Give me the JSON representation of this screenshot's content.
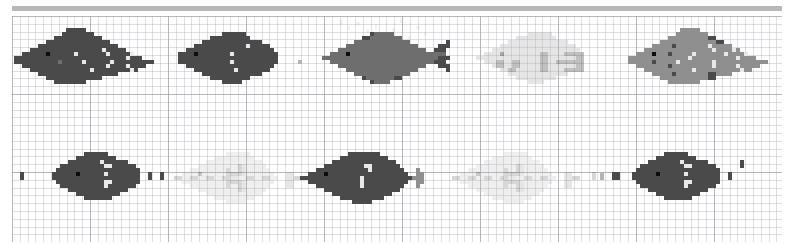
{
  "canvas": {
    "width": 790,
    "height": 244,
    "background": "#ffffff",
    "grid": {
      "minor_cell_px": 7.8,
      "major_cell_px": 78,
      "minor_color": "#afafb9",
      "major_color": "#9696a0",
      "visible": true
    },
    "topbar": {
      "color": "#b8b8b8",
      "x": 12,
      "y": 6,
      "width": 770,
      "height": 5
    }
  },
  "palette": {
    "dark": "#4a4a4a",
    "mid": "#6e6e6e",
    "light": "#8f8f8f",
    "pale": "#b4b4b4",
    "highlight": "#e8e8e8",
    "eye": "#0d0d0d",
    "ghost": "#dcdcdc"
  },
  "legend_note": "Pixel values 0-6 index into palette: 0=empty 1=dark 2=mid 3=light 4=pale 5=highlight 6=eye",
  "layout": {
    "rows": 2,
    "cols": 5,
    "cell_px": 4,
    "sprite_cols": 36,
    "sprite_rows": 14
  },
  "sprites": [
    {
      "id": "fish-r1-c1",
      "label": "fish-row1-col1",
      "row": 0,
      "col": 0,
      "x": 14,
      "y": 28,
      "facing": "left",
      "opacity": 1.0,
      "pixels": [
        "000000000000011111000000000000000000",
        "000000000000111111110000000000000000",
        "000000000011111111111100000000000000",
        "000000001111111111111111000000000000",
        "000000111111111111111111110000000000",
        "000011111111111111111151111100000000",
        "001111116111111511111115111115000000",
        "111111111111111111111111111151110000",
        "111111111112111115111111511111111110",
        "001111111111111111111115111151111000",
        "000011111111111111151111111115100000",
        "000000111111111111111111110000000000",
        "000000001111111111111100000000000000",
        "000000000011111111000000000000000000"
      ]
    },
    {
      "id": "fish-r1-c2",
      "label": "fish-row1-col2",
      "row": 0,
      "col": 1,
      "x": 170,
      "y": 28,
      "facing": "left",
      "opacity": 1.0,
      "pixels": [
        "000000000000000000000000000000000000",
        "000000000000011111100000000000000000",
        "000000000011111111110000000000000000",
        "000000001111111111111110000000000000",
        "000000111111111111151111100000000000",
        "000011111111111111111111110000000000",
        "001111611111111511111111111000000000",
        "001111111111111111111111111000000000",
        "001111111111111511111111111000004000",
        "000011111111111111111111110000000000",
        "000000111111111151111111100000000000",
        "000000001111111111111110000000000000",
        "000000000011111111110000000000000000",
        "000000000000011111000000000000000000"
      ]
    },
    {
      "id": "fish-r1-c3",
      "label": "fish-row1-col3",
      "row": 0,
      "col": 2,
      "x": 322,
      "y": 28,
      "facing": "left",
      "opacity": 1.0,
      "pixels": [
        "000000000000000000000000000000000000",
        "000000000000122222000000000000000000",
        "000000000011222222220000000000000000",
        "000000002222222222222200000000010000",
        "000000222222222222222222000001110000",
        "000022222222222222222222220011100000",
        "002222622222222222222222222222200000",
        "222222222222222222222222222221110000",
        "002222222222222222222222222211100000",
        "000022222222222222222222220001110000",
        "000000222222222222222222000000010000",
        "000000002222222222222200000000000000",
        "000000000012222222110000000000000000",
        "000000000000122220000000000000000000"
      ]
    },
    {
      "id": "fish-r1-c4",
      "label": "fish-row1-col4",
      "row": 0,
      "col": 3,
      "x": 476,
      "y": 28,
      "facing": "left",
      "opacity": 0.35,
      "pixels": [
        "000000000000000000000000000000000000",
        "000000000000044444400000000000000000",
        "000000000044444444440000000000000000",
        "000000004444444444444440000000000000",
        "000000444444444444444444400000000000",
        "000044444444444444444444440000000000",
        "004444644444444411444411111000000000",
        "444444444444444411444444411000000000",
        "004441144114444411441111111000000000",
        "000041144114444411444444411000000000",
        "000000441144444411444411111000000000",
        "000000004444444444444440000000000000",
        "000000000044444444440000000000000000",
        "000000000000044440000000000000000000"
      ]
    },
    {
      "id": "fish-r1-c5",
      "label": "fish-row1-col5",
      "row": 0,
      "col": 4,
      "x": 628,
      "y": 28,
      "facing": "left",
      "opacity": 1.0,
      "pixels": [
        "000000000000033333000000000000000000",
        "000000000000333333330000000000000000",
        "000000000033333333331100000000000000",
        "000000003333333333333311000000000000",
        "000000333331333333335333330000000000",
        "000033333333333333333533335300000000",
        "003333633313333353333333533335000000",
        "333333333333333533333333333533330000",
        "333333133333533333333533333333333330",
        "003333333313333333333533333533333000",
        "000033333333333353333333333353300000",
        "000000333331333333331133330000000000",
        "000000003333333333331100000000000000",
        "000000000033333333000000000000000000"
      ]
    },
    {
      "id": "fish-r2-c1",
      "label": "fish-row2-col1",
      "row": 1,
      "col": 0,
      "x": 20,
      "y": 148,
      "facing": "right",
      "opacity": 1.0,
      "pixels": [
        "000000000000000000000000000000000000",
        "000000000000001111110000000000000000",
        "000000000000111111111100000000000000",
        "000000000111111511111111000000000000",
        "000000011111155111111111110000000000",
        "000000111111111111111111111000000000",
        "100100111111115111111611111100000001",
        "100100111111111111111111111100000001",
        "000000111111155111111111111000000000",
        "000000011111115111111111110000000000",
        "000000000111111111111111000000000000",
        "000000000001111111111100000000000000",
        "000000000000011111110000000000000000",
        "000000000000000000000000000000000000"
      ]
    },
    {
      "id": "fish-r2-c2",
      "label": "fish-row2-col2",
      "row": 1,
      "col": 1,
      "x": 174,
      "y": 148,
      "facing": "left",
      "opacity": 0.22,
      "pixels": [
        "000000000000000000000000000000000000",
        "000000000000044444400000000000000000",
        "000000000044444444440000000000000000",
        "000000004444444444444400000000000000",
        "000000444444444413444440000000000000",
        "000044444444414413444444000000000000",
        "004444644444411113444444400033000000",
        "114411441144113344114411440033110000",
        "004444444444411113444444400033000000",
        "000044444444414413444444000033000000",
        "000000444444444413444440000000000000",
        "000000004444444444444400000000000000",
        "000000000044444444440000000000000000",
        "000000000000044444000000000000000000"
      ]
    },
    {
      "id": "fish-r2-c3",
      "label": "fish-row2-col3",
      "row": 1,
      "col": 2,
      "x": 300,
      "y": 148,
      "facing": "left",
      "opacity": 1.0,
      "pixels": [
        "000000000000000000000000000000000000",
        "000000000000111111110000000000000000",
        "000000000011111111111100000000000000",
        "000000001111111111111111000000000000",
        "000000111111111155111111100000000000",
        "000011111111111115111111110003000000",
        "001111611111111111111111111003300000",
        "111111111111111511111111111133300000",
        "001111111111111511111111111003300000",
        "000011111111111511111111110003000000",
        "000000111111111111111111100000000000",
        "000000001111111111111110000000000000",
        "000000000011111111111000000000000000",
        "000000000000011111000000000000000000"
      ]
    },
    {
      "id": "fish-r2-c4",
      "label": "fish-row2-col4",
      "row": 1,
      "col": 3,
      "x": 452,
      "y": 148,
      "facing": "left",
      "opacity": 0.22,
      "pixels": [
        "000000000000000000000000000000000000",
        "000000000000044444400000000000000000",
        "000000000044444444440000000000000000",
        "000000004444444444444400000000000000",
        "000000444444444413444440000000000000",
        "000044444444414413444444000000000000",
        "004444644444411113444444400033000001",
        "114411441144113344114411440033110001",
        "004444444444411113444444400033000000",
        "000044444444414413444444000033000000",
        "000000444444444413444440000000000000",
        "000000004444444444444400000000000000",
        "000000000044444444440000000000000000",
        "000000000000044444000000000000000000"
      ]
    },
    {
      "id": "fish-r2-c5",
      "label": "fish-row2-col5",
      "row": 1,
      "col": 4,
      "x": 600,
      "y": 148,
      "facing": "right",
      "opacity": 1.0,
      "pixels": [
        "000000000000000000000000000000000000",
        "000000000000001111110000000000000000",
        "000000000000111111111100000000000000",
        "100000000111111511111111000000000000",
        "100000011111155111111111110000000000",
        "000000111111111111111111111000000000",
        "000100111111115111111611111100011004",
        "000100111111111111111111111100011004",
        "000000111111155111111111111000000000",
        "000000011111115111111111110000000000",
        "000000000111111111111111000000000000",
        "000000000001111111111100000000000000",
        "000000000000011111110000000000000000",
        "000000000000000000000000000000000000"
      ]
    }
  ],
  "smudges": [
    {
      "x": 340,
      "y": 20,
      "w": 3,
      "h": 5
    },
    {
      "x": 348,
      "y": 26,
      "w": 2,
      "h": 4
    },
    {
      "x": 356,
      "y": 22,
      "w": 4,
      "h": 3
    },
    {
      "x": 366,
      "y": 30,
      "w": 3,
      "h": 3
    },
    {
      "x": 375,
      "y": 24,
      "w": 2,
      "h": 6
    },
    {
      "x": 382,
      "y": 34,
      "w": 4,
      "h": 3
    },
    {
      "x": 392,
      "y": 28,
      "w": 3,
      "h": 4
    },
    {
      "x": 400,
      "y": 18,
      "w": 2,
      "h": 5
    },
    {
      "x": 408,
      "y": 36,
      "w": 3,
      "h": 3
    },
    {
      "x": 416,
      "y": 26,
      "w": 4,
      "h": 3
    },
    {
      "x": 424,
      "y": 32,
      "w": 2,
      "h": 4
    }
  ]
}
